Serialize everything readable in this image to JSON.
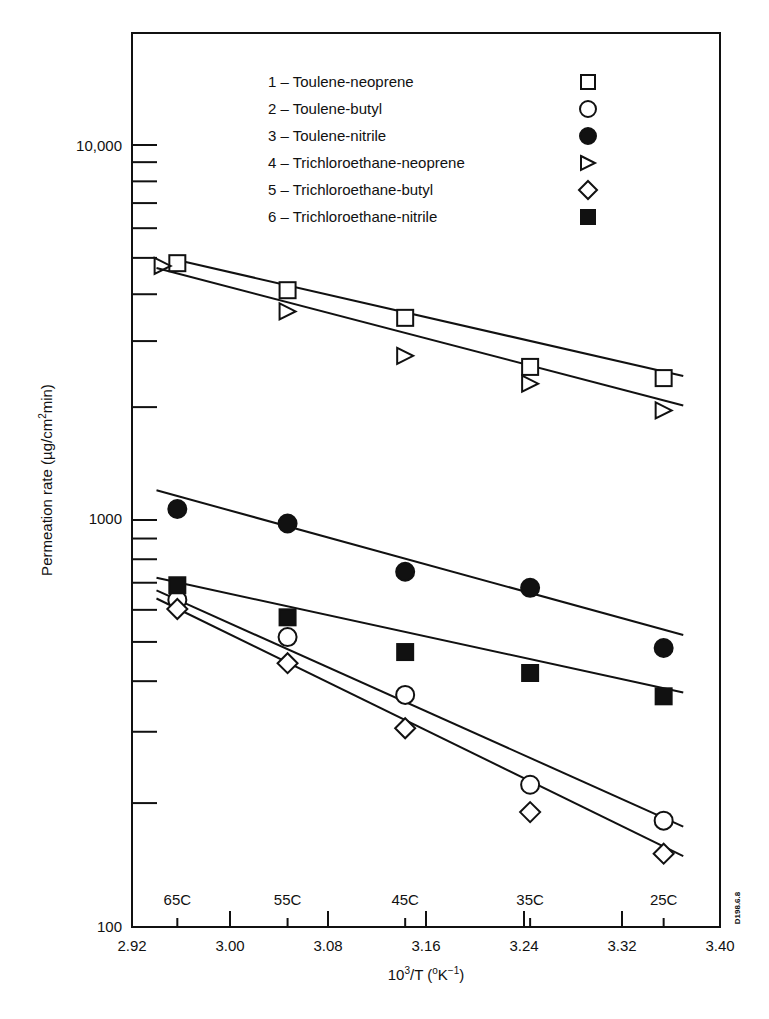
{
  "chart_data": {
    "type": "scatter",
    "title": "",
    "xlabel": "10³/T (°K⁻¹)",
    "ylabel": "Permeation rate (µg/cm²min)",
    "xlim": [
      2.92,
      3.4
    ],
    "ylim": [
      100,
      20000
    ],
    "yscale": "log",
    "grid": false,
    "legend_position": "upper center (inside plot)",
    "x_ticks": [
      "2.92",
      "3.00",
      "3.08",
      "3.16",
      "3.24",
      "3.32",
      "3.40"
    ],
    "y_ticks": [
      "100",
      "1000",
      "10,000"
    ],
    "temperature_marks": [
      {
        "label": "65C",
        "x": 2.957
      },
      {
        "label": "55C",
        "x": 3.047
      },
      {
        "label": "45C",
        "x": 3.143
      },
      {
        "label": "35C",
        "x": 3.245
      },
      {
        "label": "25C",
        "x": 3.354
      }
    ],
    "x": [
      2.957,
      3.047,
      3.143,
      3.245,
      3.354
    ],
    "series": [
      {
        "id": 1,
        "name": "Toulene-neoprene",
        "marker": "open-square",
        "values": [
          4840,
          4100,
          3460,
          2560,
          2390
        ],
        "fit": [
          4950,
          2420
        ]
      },
      {
        "id": 2,
        "name": "Toulene-butyl",
        "marker": "open-circle",
        "values": [
          635,
          514,
          370,
          222,
          181
        ],
        "fit": [
          670,
          175
        ]
      },
      {
        "id": 3,
        "name": "Toulene-nitrile",
        "marker": "filled-circle",
        "values": [
          1070,
          980,
          745,
          680,
          483
        ],
        "fit": [
          1200,
          520
        ]
      },
      {
        "id": 4,
        "name": "Trichloroethane-neoprene",
        "marker": "open-triangle-right",
        "values": [
          4760,
          3600,
          2740,
          2310,
          1960
        ],
        "fit": [
          4700,
          2020
        ]
      },
      {
        "id": 5,
        "name": "Trichloroethane-butyl",
        "marker": "open-diamond",
        "values": [
          603,
          443,
          306,
          190,
          150
        ],
        "fit": [
          640,
          148
        ]
      },
      {
        "id": 6,
        "name": "Trichloroethane-nitrile",
        "marker": "filled-square",
        "values": [
          690,
          575,
          472,
          419,
          367
        ],
        "fit": [
          720,
          375
        ]
      }
    ],
    "fit_x": [
      2.94,
      3.37
    ],
    "annotations": [
      "D198.6.8"
    ]
  },
  "legend": {
    "items": [
      {
        "label": "1 – Toulene-neoprene"
      },
      {
        "label": "2 – Toulene-butyl"
      },
      {
        "label": "3 – Toulene-nitrile"
      },
      {
        "label": "4 – Trichloroethane-neoprene"
      },
      {
        "label": "5 – Trichloroethane-butyl"
      },
      {
        "label": "6 – Trichloroethane-nitrile"
      }
    ]
  },
  "axes": {
    "xlabel_main": "10",
    "xlabel_sup": "3",
    "xlabel_rest": "/T (",
    "xlabel_deg": "o",
    "xlabel_K": "K",
    "xlabel_exp": "−1",
    "xlabel_close": ")",
    "ylabel_pre": "Permeation rate (µg/cm",
    "ylabel_sup": "2",
    "ylabel_post": "min)"
  },
  "colors": {
    "ink": "#111111",
    "background": "#ffffff"
  }
}
